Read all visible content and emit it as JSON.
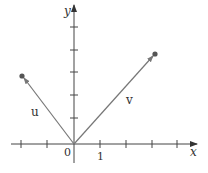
{
  "figure": {
    "type": "vector-diagram",
    "axes": {
      "x_label": "x",
      "y_label": "y",
      "origin_label": "0",
      "unit_tick_label": "1",
      "x_ticks": [
        -2,
        -1,
        1,
        2,
        3,
        4
      ],
      "y_ticks": [
        1,
        2,
        3,
        4,
        5
      ]
    },
    "vectors": [
      {
        "name": "u",
        "label": "u",
        "from": [
          0,
          0
        ],
        "to": [
          -2,
          3
        ]
      },
      {
        "name": "v",
        "label": "v",
        "from": [
          0,
          0
        ],
        "to": [
          3,
          4
        ]
      }
    ],
    "colors": {
      "axis": "#444444",
      "vector": "#777777",
      "endpoint": "#555555",
      "text": "#333333"
    }
  }
}
